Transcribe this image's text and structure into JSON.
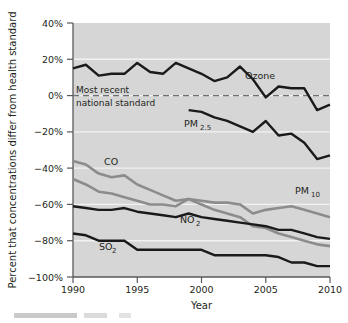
{
  "figure": {
    "background_color": "#ffffff",
    "plot_background_color": "#d6d6d6",
    "gridline_color": "#f2f2f2",
    "axis_color": "#58595b",
    "dark_series_color": "#1a1a1a",
    "gray_series_color": "#8c8c8c",
    "standard_line_color": "#6d6e71"
  },
  "axes": {
    "y_title": "Percent that concentrations differ from health standard",
    "x_title": "Year",
    "y_ticks": [
      "40%",
      "20%",
      "0%",
      "−20%",
      "−40%",
      "−60%",
      "−80%",
      "−100%"
    ],
    "y_tick_values": [
      40,
      20,
      0,
      -20,
      -40,
      -60,
      -80,
      -100
    ],
    "x_ticks": [
      "1990",
      "1995",
      "2000",
      "2005",
      "2010"
    ],
    "x_tick_values": [
      1990,
      1995,
      2000,
      2005,
      2010
    ],
    "ylim": [
      -100,
      40
    ],
    "xlim": [
      1990,
      2010
    ]
  },
  "annotation": {
    "standard_line_label_line1": "Most recent",
    "standard_line_label_line2": "national standard",
    "standard_line_value": 0
  },
  "series_labels": {
    "ozone": "Ozone",
    "pm25_main": "PM",
    "pm25_sub": "2.5",
    "pm10_main": "PM",
    "pm10_sub": "10",
    "co": "CO",
    "no2_main": "NO",
    "no2_sub": "2",
    "so2_main": "SO",
    "so2_sub": "2"
  },
  "chart_data": {
    "type": "line",
    "title": "",
    "xlabel": "Year",
    "ylabel": "Percent that concentrations differ from health standard",
    "xlim": [
      1990,
      2010
    ],
    "ylim": [
      -100,
      40
    ],
    "grid": true,
    "legend": "inline-labels",
    "reference_line": {
      "value": 0,
      "label": "Most recent national standard",
      "style": "dashed"
    },
    "x": [
      1990,
      1991,
      1992,
      1993,
      1994,
      1995,
      1996,
      1997,
      1998,
      1999,
      2000,
      2001,
      2002,
      2003,
      2004,
      2005,
      2006,
      2007,
      2008,
      2009,
      2010
    ],
    "series": [
      {
        "name": "Ozone",
        "color": "#1a1a1a",
        "values": [
          15,
          17,
          11,
          12,
          12,
          18,
          13,
          12,
          18,
          15,
          12,
          8,
          10,
          16,
          9,
          -1,
          5,
          4,
          4,
          -8,
          -5
        ]
      },
      {
        "name": "PM2.5",
        "color": "#1a1a1a",
        "x": [
          1999,
          2000,
          2001,
          2002,
          2003,
          2004,
          2005,
          2006,
          2007,
          2008,
          2009,
          2010
        ],
        "values": [
          -8,
          -9,
          -12,
          -14,
          -17,
          -20,
          -14,
          -22,
          -21,
          -26,
          -35,
          -33
        ]
      },
      {
        "name": "CO",
        "color": "#8c8c8c",
        "values": [
          -36,
          -38,
          -43,
          -45,
          -44,
          -49,
          -52,
          -55,
          -58,
          -57,
          -60,
          -63,
          -65,
          -67,
          -72,
          -73,
          -76,
          -78,
          -80,
          -82,
          -83
        ]
      },
      {
        "name": "PM10",
        "color": "#8c8c8c",
        "values": [
          -46,
          -49,
          -53,
          -54,
          -56,
          -58,
          -60,
          -60,
          -61,
          -57,
          -58,
          -59,
          -59,
          -60,
          -65,
          -63,
          -62,
          -61,
          -63,
          -65,
          -67
        ]
      },
      {
        "name": "NO2",
        "color": "#1a1a1a",
        "values": [
          -61,
          -62,
          -63,
          -63,
          -62,
          -64,
          -65,
          -66,
          -67,
          -65,
          -67,
          -68,
          -69,
          -70,
          -71,
          -72,
          -74,
          -74,
          -76,
          -78,
          -79
        ]
      },
      {
        "name": "SO2",
        "color": "#1a1a1a",
        "values": [
          -76,
          -77,
          -80,
          -80,
          -80,
          -85,
          -85,
          -85,
          -85,
          -85,
          -85,
          -88,
          -88,
          -88,
          -88,
          -88,
          -89,
          -92,
          -92,
          -94,
          -94
        ]
      }
    ],
    "inline_annotations": [
      {
        "text": "Ozone",
        "x": 2003.0,
        "y": 9
      },
      {
        "text": "PM2.5",
        "x": 1997.6,
        "y": -15
      },
      {
        "text": "PM10",
        "x": 2006.3,
        "y": -55
      },
      {
        "text": "CO",
        "x": 1992.6,
        "y": -39
      },
      {
        "text": "NO2",
        "x": 2000.0,
        "y": -74
      },
      {
        "text": "SO2",
        "x": 1993.4,
        "y": -85
      }
    ]
  }
}
